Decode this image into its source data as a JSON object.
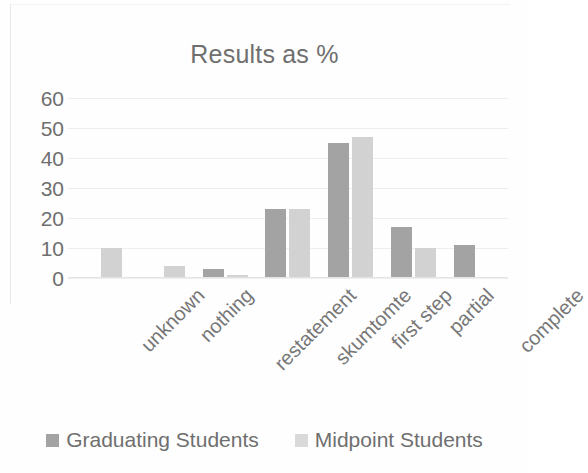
{
  "chart_data": {
    "type": "bar",
    "title": "Results as %",
    "xlabel": "",
    "ylabel": "",
    "ylim": [
      0,
      60
    ],
    "yticks": [
      60,
      50,
      40,
      30,
      20,
      10,
      0
    ],
    "grid": true,
    "legend_position": "bottom",
    "categories": [
      "unknown",
      "nothing",
      "restatement",
      "skumtomte",
      "first step",
      "partial",
      "complete"
    ],
    "series": [
      {
        "name": "Graduating Students",
        "color": "#a3a3a3",
        "values": [
          0,
          0,
          3,
          23,
          45,
          17,
          11
        ]
      },
      {
        "name": "Midpoint Students",
        "color": "#d2d2d2",
        "values": [
          10,
          4,
          1,
          23,
          47,
          10,
          0.5
        ]
      }
    ]
  },
  "colors": {
    "title_text": "#6f6f6f",
    "axis_text": "#6f6f6f",
    "gridline": "#eeeeee",
    "background": "#fefefe"
  }
}
